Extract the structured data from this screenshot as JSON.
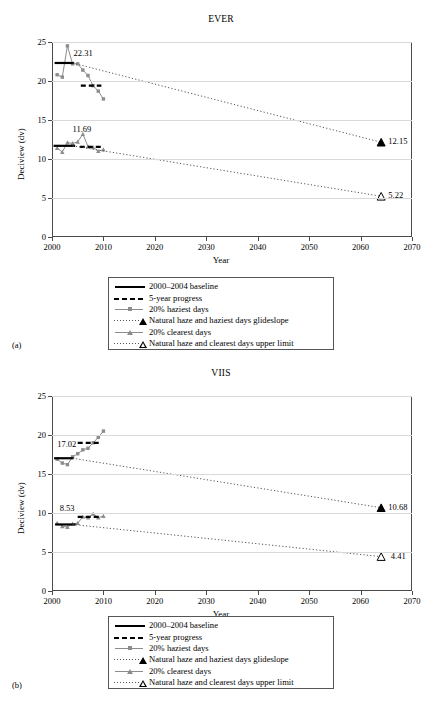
{
  "figure": {
    "panels": [
      {
        "sublabel": "(a)",
        "title": "EVER",
        "xlabel": "Year",
        "ylabel": "Deciview (dv)"
      },
      {
        "sublabel": "(b)",
        "title": "VIIS",
        "xlabel": "Year",
        "ylabel": "Deciview (dv)"
      }
    ],
    "legend": {
      "items": [
        {
          "label": "2000–2004 baseline",
          "key": "solid-line"
        },
        {
          "label": "5-year progress",
          "key": "dashed-line"
        },
        {
          "label": "20% haziest days",
          "key": "line-square-marker"
        },
        {
          "label": "Natural haze and haziest days glideslope",
          "key": "dotted-filled-triangle"
        },
        {
          "label": "20% clearest days",
          "key": "line-triangle-marker"
        },
        {
          "label": "Natural haze and clearest days upper limit",
          "key": "dotted-open-triangle"
        }
      ]
    }
  },
  "chart_data": [
    {
      "type": "line",
      "title": "EVER",
      "xlabel": "Year",
      "ylabel": "Deciview (dv)",
      "xlim": [
        2000,
        2070
      ],
      "ylim": [
        0,
        25
      ],
      "xticks": [
        2000,
        2010,
        2020,
        2030,
        2040,
        2050,
        2060,
        2070
      ],
      "yticks": [
        0,
        5,
        10,
        15,
        20,
        25
      ],
      "grid": "horizontal",
      "legend_position": "below",
      "annotations": [
        {
          "text": "22.31",
          "x": 2004.2,
          "y": 23.4
        },
        {
          "text": "11.69",
          "x": 2004.0,
          "y": 13.7
        },
        {
          "text": "12.15",
          "x": 2065.0,
          "y": 12.15
        },
        {
          "text": "5.22",
          "x": 2065.0,
          "y": 5.22
        }
      ],
      "series": [
        {
          "name": "20% haziest days",
          "style": "line-square-marker",
          "color": "#8c8c8c",
          "x": [
            2001,
            2002,
            2003,
            2004,
            2005,
            2006,
            2007,
            2008,
            2009,
            2010
          ],
          "values": [
            20.8,
            20.5,
            24.5,
            22.2,
            22.2,
            21.4,
            20.7,
            19.4,
            18.7,
            17.7
          ]
        },
        {
          "name": "20% clearest days",
          "style": "line-triangle-marker",
          "color": "#8c8c8c",
          "x": [
            2001,
            2002,
            2003,
            2004,
            2005,
            2006,
            2007,
            2008,
            2009,
            2010
          ],
          "values": [
            11.4,
            10.9,
            12.1,
            12.0,
            12.2,
            13.2,
            11.6,
            11.5,
            11.0,
            11.2
          ]
        },
        {
          "name": "2000–2004 baseline (haziest)",
          "style": "solid-line",
          "color": "#000000",
          "x": [
            2000.5,
            2004.3
          ],
          "values": [
            22.31,
            22.31
          ]
        },
        {
          "name": "2000–2004 baseline (clearest)",
          "style": "solid-line",
          "color": "#000000",
          "x": [
            2000.3,
            2004.5
          ],
          "values": [
            11.69,
            11.69
          ]
        },
        {
          "name": "5-year progress (haziest)",
          "style": "dashed-line",
          "color": "#000000",
          "x": [
            2005.6,
            2009.6
          ],
          "values": [
            19.4,
            19.4
          ]
        },
        {
          "name": "5-year progress (clearest)",
          "style": "dashed-line",
          "color": "#000000",
          "x": [
            2005.4,
            2009.6
          ],
          "values": [
            11.55,
            11.55
          ]
        },
        {
          "name": "Natural haze and haziest days glideslope",
          "style": "dotted-filled-triangle",
          "color": "#555555",
          "x": [
            2004,
            2064
          ],
          "values": [
            22.31,
            12.15
          ]
        },
        {
          "name": "Natural haze and clearest days upper limit",
          "style": "dotted-open-triangle",
          "color": "#555555",
          "x": [
            2004,
            2064
          ],
          "values": [
            11.69,
            5.22
          ]
        }
      ]
    },
    {
      "type": "line",
      "title": "VIIS",
      "xlabel": "Year",
      "ylabel": "Deciview (dv)",
      "xlim": [
        2000,
        2070
      ],
      "ylim": [
        0,
        25
      ],
      "xticks": [
        2000,
        2010,
        2020,
        2030,
        2040,
        2050,
        2060,
        2070
      ],
      "yticks": [
        0,
        5,
        10,
        15,
        20,
        25
      ],
      "grid": "horizontal",
      "legend_position": "below",
      "annotations": [
        {
          "text": "17.02",
          "x": 2001.0,
          "y": 18.7
        },
        {
          "text": "8.53",
          "x": 2001.5,
          "y": 10.5
        },
        {
          "text": "10.68",
          "x": 2065.0,
          "y": 10.68
        },
        {
          "text": "4.41",
          "x": 2065.5,
          "y": 4.41
        }
      ],
      "series": [
        {
          "name": "20% haziest days",
          "style": "line-square-marker",
          "color": "#8c8c8c",
          "x": [
            2001,
            2002,
            2003,
            2004,
            2005,
            2006,
            2007,
            2008,
            2009,
            2010
          ],
          "values": [
            16.9,
            16.4,
            16.2,
            17.2,
            17.6,
            18.1,
            18.3,
            19.0,
            19.7,
            20.5
          ]
        },
        {
          "name": "20% clearest days",
          "style": "line-triangle-marker",
          "color": "#8c8c8c",
          "x": [
            2001,
            2002,
            2003,
            2004,
            2005,
            2006,
            2007,
            2008,
            2009,
            2010
          ],
          "values": [
            8.7,
            8.3,
            8.2,
            8.6,
            8.7,
            9.5,
            9.4,
            9.9,
            9.4,
            9.6
          ]
        },
        {
          "name": "2000–2004 baseline (haziest)",
          "style": "solid-line",
          "color": "#000000",
          "x": [
            2000.4,
            2004.2
          ],
          "values": [
            17.02,
            17.02
          ]
        },
        {
          "name": "2000–2004 baseline (clearest)",
          "style": "solid-line",
          "color": "#000000",
          "x": [
            2000.6,
            2004.6
          ],
          "values": [
            8.53,
            8.53
          ]
        },
        {
          "name": "5-year progress (haziest)",
          "style": "dashed-line",
          "color": "#000000",
          "x": [
            2005.0,
            2009.6
          ],
          "values": [
            19.0,
            19.0
          ]
        },
        {
          "name": "5-year progress (clearest)",
          "style": "dashed-line",
          "color": "#000000",
          "x": [
            2005.0,
            2009.6
          ],
          "values": [
            9.5,
            9.5
          ]
        },
        {
          "name": "Natural haze and haziest days glideslope",
          "style": "dotted-filled-triangle",
          "color": "#555555",
          "x": [
            2004,
            2064
          ],
          "values": [
            17.02,
            10.68
          ]
        },
        {
          "name": "Natural haze and clearest days upper limit",
          "style": "dotted-open-triangle",
          "color": "#555555",
          "x": [
            2004,
            2064
          ],
          "values": [
            8.53,
            4.41
          ]
        }
      ]
    }
  ]
}
